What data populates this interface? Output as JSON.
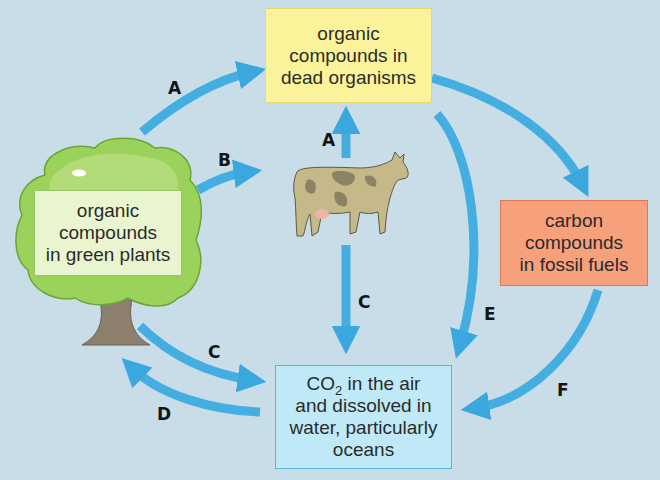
{
  "diagram": {
    "nodes": {
      "dead_organisms": {
        "lines": [
          "organic",
          "compounds in",
          "dead organisms"
        ],
        "color": "#fbf39a"
      },
      "green_plants": {
        "lines": [
          "organic",
          "compounds",
          "in green plants"
        ],
        "color": "#e9f5cf"
      },
      "fossil_fuels": {
        "lines": [
          "carbon",
          "compounds",
          "in fossil fuels"
        ],
        "color": "#f6a07c"
      },
      "co2": {
        "line1_prefix": "CO",
        "line1_sub": "2",
        "line1_suffix": " in the air",
        "lines_rest": [
          "and dissolved in",
          "water, particularly",
          "oceans"
        ],
        "color": "#bfe9f6"
      }
    },
    "arrows": [
      {
        "label": "A",
        "from": "green_plants",
        "to": "dead_organisms"
      },
      {
        "label": "B",
        "from": "green_plants",
        "to": "animals"
      },
      {
        "label": "A",
        "from": "animals",
        "to": "dead_organisms"
      },
      {
        "label": "C",
        "from": "animals",
        "to": "co2"
      },
      {
        "label": "C",
        "from": "green_plants",
        "to": "co2"
      },
      {
        "label": "D",
        "from": "co2",
        "to": "green_plants"
      },
      {
        "label": "E",
        "from": "dead_organisms",
        "to": "co2"
      },
      {
        "label": "F",
        "from": "fossil_fuels",
        "to": "co2"
      },
      {
        "label": "",
        "from": "dead_organisms",
        "to": "fossil_fuels"
      }
    ],
    "illustrations": [
      "tree",
      "cow"
    ],
    "arrow_color": "#45aee0",
    "background": "#c8dde8"
  }
}
